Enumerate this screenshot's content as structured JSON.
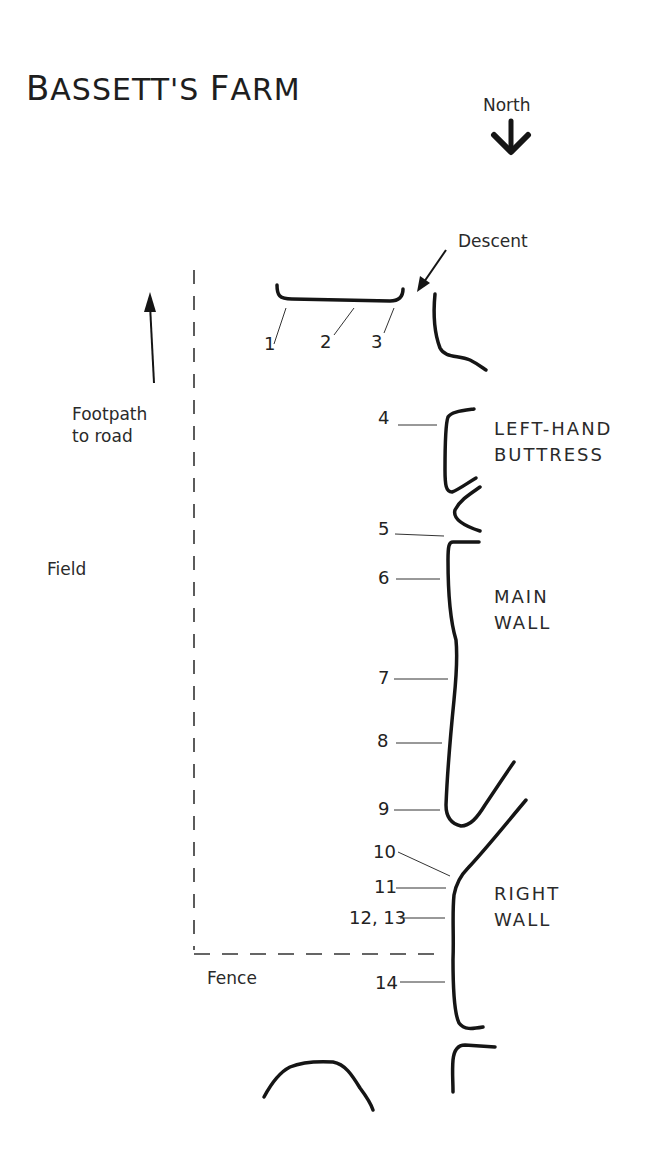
{
  "title": "Bassett's Farm",
  "title_display": {
    "first": "B",
    "rest1": "ASSETT'S ",
    "second": "F",
    "rest2": "ARM"
  },
  "compass": {
    "label": "North",
    "direction": "down",
    "icon": "arrow-down-icon"
  },
  "annotations": {
    "descent": "Descent",
    "footpath_line1": "Footpath",
    "footpath_line2": "to road",
    "field": "Field",
    "fence": "Fence"
  },
  "sections": {
    "left_hand_buttress": {
      "line1": "LEFT-HAND",
      "line2": "BUTTRESS"
    },
    "main_wall": {
      "line1": "MAIN",
      "line2": "WALL"
    },
    "right_wall": {
      "line1": "RIGHT",
      "line2": "WALL"
    }
  },
  "routes": [
    {
      "id": "1",
      "label": "1"
    },
    {
      "id": "2",
      "label": "2"
    },
    {
      "id": "3",
      "label": "3"
    },
    {
      "id": "4",
      "label": "4"
    },
    {
      "id": "5",
      "label": "5"
    },
    {
      "id": "6",
      "label": "6"
    },
    {
      "id": "7",
      "label": "7"
    },
    {
      "id": "8",
      "label": "8"
    },
    {
      "id": "9",
      "label": "9"
    },
    {
      "id": "10",
      "label": "10"
    },
    {
      "id": "11",
      "label": "11"
    },
    {
      "id": "12-13",
      "label": "12, 13"
    },
    {
      "id": "14",
      "label": "14"
    }
  ],
  "colors": {
    "ink": "#151515",
    "paper": "#ffffff"
  }
}
